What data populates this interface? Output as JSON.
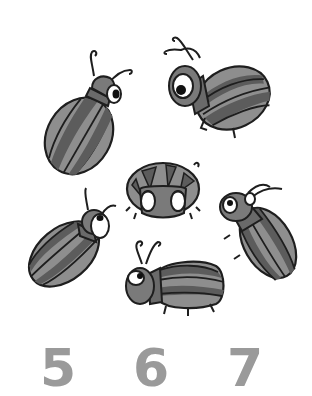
{
  "worksheet": {
    "task": "count-the-beetles",
    "beetle_count_shown": 6,
    "colors": {
      "outline": "#1e1e1e",
      "stripe_dark": "#5c5c5c",
      "stripe_light": "#8e8e8e",
      "head": "#7a7a7a",
      "eye_white": "#ffffff",
      "pupil": "#111111",
      "numeral": "#9a9a9a"
    },
    "beetles": [
      {
        "id": "top-left",
        "pose": "facing-right-up"
      },
      {
        "id": "top-right",
        "pose": "facing-left"
      },
      {
        "id": "center",
        "pose": "facing-viewer"
      },
      {
        "id": "middle-right",
        "pose": "facing-up-left"
      },
      {
        "id": "bottom-left",
        "pose": "facing-right-up"
      },
      {
        "id": "bottom-center",
        "pose": "facing-left"
      }
    ],
    "answer_choices": [
      {
        "label": "5"
      },
      {
        "label": "6"
      },
      {
        "label": "7"
      }
    ]
  }
}
